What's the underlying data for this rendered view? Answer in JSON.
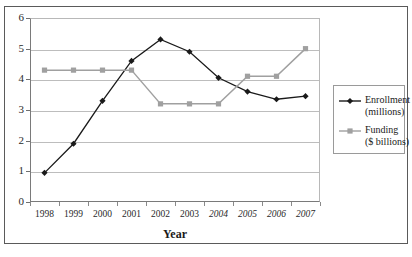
{
  "chart_data": {
    "type": "line",
    "title": "",
    "xlabel": "Year",
    "ylabel": "",
    "categories": [
      "1998",
      "1999",
      "2000",
      "2001",
      "2002",
      "2003",
      "2004",
      "2005",
      "2006",
      "2007"
    ],
    "ylim": [
      0,
      6
    ],
    "ytick_labels": [
      "0",
      "1",
      "2",
      "3",
      "4",
      "5",
      "6"
    ],
    "grid": true,
    "legend_position": "right",
    "series": [
      {
        "name": "Enrollment",
        "unit": "(millions)",
        "color": "#1a1a1a",
        "marker": "diamond",
        "values": [
          0.95,
          1.9,
          3.3,
          4.6,
          5.3,
          4.9,
          4.05,
          3.6,
          3.35,
          3.45
        ]
      },
      {
        "name": "Funding",
        "unit": "($ billions)",
        "color": "#a0a0a0",
        "marker": "square",
        "values": [
          4.3,
          4.3,
          4.3,
          4.3,
          3.2,
          3.2,
          3.2,
          4.1,
          4.1,
          5.0
        ]
      }
    ]
  },
  "axes": {
    "x_title": "Year",
    "y_ticks": [
      "6",
      "5",
      "4",
      "3",
      "2",
      "1",
      "0"
    ],
    "x_labels": [
      {
        "text": "1998",
        "italic": false
      },
      {
        "text": "1999",
        "italic": false
      },
      {
        "text": "2000",
        "italic": false
      },
      {
        "text": "2001",
        "italic": false
      },
      {
        "text": "2002",
        "italic": false
      },
      {
        "text": "2003",
        "italic": false
      },
      {
        "text": "2004",
        "italic": true
      },
      {
        "text": "2005",
        "italic": true
      },
      {
        "text": "2006",
        "italic": true
      },
      {
        "text": "2007",
        "italic": true
      }
    ]
  },
  "legend": {
    "entries": [
      {
        "label": "Enrollment",
        "sublabel": "(millions)",
        "color": "#1a1a1a",
        "marker": "diamond"
      },
      {
        "label": "Funding",
        "sublabel": "($ billions)",
        "color": "#a0a0a0",
        "marker": "square"
      }
    ]
  }
}
